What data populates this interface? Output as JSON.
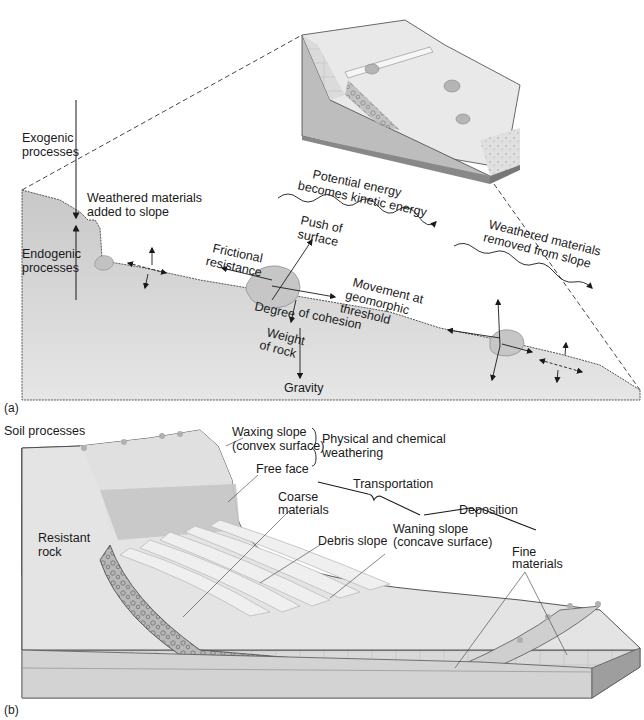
{
  "figure": {
    "colors": {
      "ground": "#d4d4d4",
      "ground_dark": "#bdbdbd",
      "rock": "#cfcfcf",
      "resistant_rock": "#9a9a9a",
      "free_face_band": "#c2c2c2",
      "surface_light": "#ececec",
      "line": "#1a1a1a"
    }
  },
  "panel_a": {
    "label": "(a)",
    "labels": {
      "exogenic": [
        "Exogenic",
        "processes"
      ],
      "endogenic": [
        "Endogenic",
        "processes"
      ],
      "weathered_added": [
        "Weathered materials",
        "added to slope"
      ],
      "potential_energy": [
        "Potential energy",
        "becomes kinetic energy"
      ],
      "weathered_removed": [
        "Weathered materials",
        "removed from slope"
      ],
      "push_of_surface": [
        "Push of",
        "surface"
      ],
      "frictional_resistance": [
        "Frictional",
        "resistance"
      ],
      "movement_threshold": [
        "Movement at",
        "geomorphic",
        "threshold"
      ],
      "degree": "Degree",
      "of_cohesion": "of cohesion",
      "weight_of_rock": [
        "Weight",
        "of rock"
      ],
      "gravity": "Gravity"
    }
  },
  "panel_b": {
    "label": "(b)",
    "labels": {
      "soil_processes": "Soil processes",
      "waxing_slope": [
        "Waxing slope",
        "(convex surface)"
      ],
      "physical_chemical": [
        "Physical and chemical",
        "weathering"
      ],
      "free_face": "Free face",
      "transportation": "Transportation",
      "deposition": "Deposition",
      "coarse_materials": [
        "Coarse",
        "materials"
      ],
      "resistant_rock": [
        "Resistant",
        "rock"
      ],
      "debris_slope": "Debris slope",
      "waning_slope": [
        "Waning slope",
        "(concave surface)"
      ],
      "fine_materials": [
        "Fine",
        "materials"
      ]
    }
  }
}
